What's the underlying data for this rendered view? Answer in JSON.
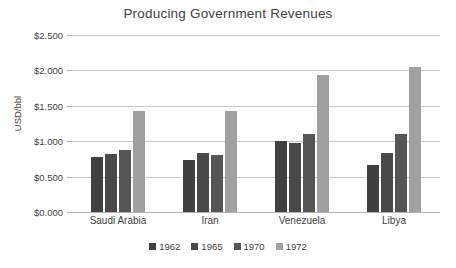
{
  "chart_data": {
    "type": "bar",
    "title": "Producing Government Revenues",
    "xlabel": "",
    "ylabel": "USD/bbl",
    "ylim": [
      0,
      2.5
    ],
    "ytick_step": 0.5,
    "ytick_labels": [
      "$0.000",
      "$0.500",
      "$1.000",
      "$1.500",
      "$2.000",
      "$2.500"
    ],
    "ytick_values": [
      0,
      0.5,
      1.0,
      1.5,
      2.0,
      2.5
    ],
    "grid": true,
    "legend_position": "bottom",
    "categories": [
      "Saudi Arabia",
      "Iran",
      "Venezuela",
      "Libya"
    ],
    "series": [
      {
        "name": "1962",
        "color": "#404040",
        "values": [
          0.78,
          0.74,
          1.0,
          0.66
        ]
      },
      {
        "name": "1965",
        "color": "#494949",
        "values": [
          0.82,
          0.84,
          0.98,
          0.84
        ]
      },
      {
        "name": "1970",
        "color": "#555555",
        "values": [
          0.88,
          0.8,
          1.1,
          1.1
        ]
      },
      {
        "name": "1972",
        "color": "#a0a0a0",
        "values": [
          1.42,
          1.42,
          1.93,
          2.05
        ]
      }
    ]
  },
  "axis": {
    "gridline_color": "#c8c8c8",
    "baseline_color": "#b4b4b4"
  }
}
